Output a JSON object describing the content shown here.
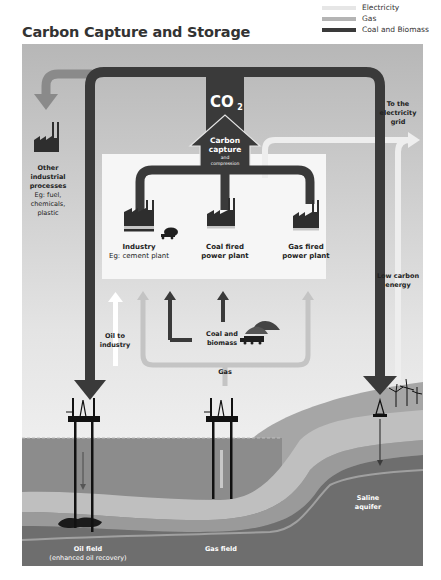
{
  "title": "Carbon Capture and Storage",
  "legend": [
    {
      "label": "Electricity",
      "color": "#e6e6e6"
    },
    {
      "label": "Gas",
      "color": "#b4b4b4"
    },
    {
      "label": "Coal and Biomass",
      "color": "#3a3a3a"
    }
  ],
  "co2_label": "CO",
  "co2_subscript": "2",
  "capture": {
    "line1": "Carbon",
    "line2": "capture",
    "line3": "and",
    "line4": "compression"
  },
  "other_industrial": {
    "line1": "Other",
    "line2": "industrial",
    "line3": "processes",
    "line4": "Eg: fuel,",
    "line5": "chemicals,",
    "line6": "plastic"
  },
  "electricity_grid": {
    "line1": "To the",
    "line2": "electricity",
    "line3": "grid"
  },
  "plants": [
    {
      "line1": "Industry",
      "line2": "Eg: cement plant"
    },
    {
      "line1": "Coal fired",
      "line2": "power plant"
    },
    {
      "line1": "Gas fired",
      "line2": "power plant"
    }
  ],
  "low_carbon": {
    "line1": "Low carbon",
    "line2": "energy"
  },
  "oil_to_industry": {
    "line1": "Oil to",
    "line2": "industry"
  },
  "coal_biomass": {
    "line1": "Coal and",
    "line2": "biomass"
  },
  "gas_label": "Gas",
  "storage_sites": [
    {
      "line1": "Oil field",
      "line2": "(enhanced oil recovery)"
    },
    {
      "line1": "Gas field"
    },
    {
      "line1": "Saline",
      "line2": "aquifer"
    }
  ],
  "colors": {
    "panel_top": "#b9b9b9",
    "panel_mid": "#e8e8e8",
    "white_box": "#f5f5f5",
    "co2_flow": "#3a3a3a",
    "gas_flow": "#c4c4c4",
    "electricity_flow": "#efefef",
    "sea": "#8a8a8a",
    "rock_deep": "#6f6f6f",
    "rock_light": "#bcbcbc"
  }
}
